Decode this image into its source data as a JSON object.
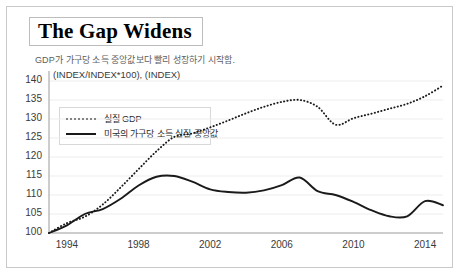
{
  "title": "The Gap Widens",
  "subtitle": "GDP가 가구당 소득 중앙값보다 빨리 성장하기 시작함.",
  "unit_label": "(INDEX/INDEX*100), (INDEX)",
  "legend": {
    "gdp": "실질 GDP",
    "median": "미국의 가구당 소득 실질 중앙값"
  },
  "chart_data": {
    "type": "line",
    "title": "The Gap Widens",
    "subtitle": "GDP가 가구당 소득 중앙값보다 빨리 성장하기 시작함.",
    "xlabel": "",
    "ylabel": "(INDEX/INDEX*100), (INDEX)",
    "ylim": [
      100,
      140
    ],
    "yticks": [
      100,
      105,
      110,
      115,
      120,
      125,
      130,
      135,
      140
    ],
    "xlim": [
      1993,
      2015
    ],
    "xticks": [
      1994,
      1998,
      2002,
      2006,
      2010,
      2014
    ],
    "grid": true,
    "legend_position": "upper-left",
    "x": [
      1993,
      1994,
      1995,
      1996,
      1997,
      1998,
      1999,
      2000,
      2001,
      2002,
      2003,
      2004,
      2005,
      2006,
      2007,
      2008,
      2009,
      2010,
      2011,
      2012,
      2013,
      2014,
      2015
    ],
    "series": [
      {
        "name": "실질 GDP",
        "style": "dotted",
        "color": "#1a1a1a",
        "values": [
          100.0,
          102.6,
          104.3,
          107.5,
          112.0,
          116.8,
          121.5,
          125.3,
          126.2,
          127.8,
          129.6,
          131.5,
          133.2,
          134.5,
          135.0,
          133.2,
          128.5,
          130.2,
          131.4,
          132.7,
          134.0,
          136.0,
          138.8
        ]
      },
      {
        "name": "미국의 가구당 소득 실질 중앙값",
        "style": "solid",
        "color": "#1a1a1a",
        "values": [
          100.0,
          102.0,
          105.0,
          106.3,
          109.0,
          112.5,
          114.8,
          115.0,
          113.5,
          111.5,
          110.8,
          110.6,
          111.2,
          112.6,
          114.6,
          111.0,
          110.0,
          108.2,
          106.0,
          104.4,
          104.4,
          108.4,
          107.3
        ]
      }
    ]
  }
}
